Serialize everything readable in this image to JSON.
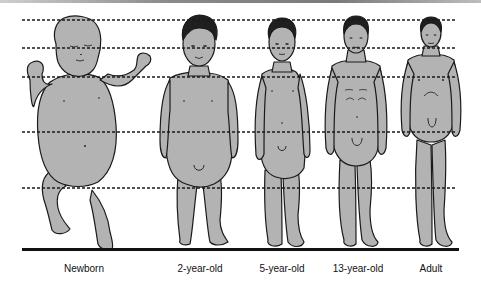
{
  "diagram": {
    "figures": [
      {
        "label": "Newborn",
        "center_x": 84
      },
      {
        "label": "2-year-old",
        "center_x": 200
      },
      {
        "label": "5-year-old",
        "center_x": 282
      },
      {
        "label": "13-year-old",
        "center_x": 356
      },
      {
        "label": "Adult",
        "center_x": 431
      }
    ],
    "reference_lines_y": [
      20,
      48,
      77,
      132,
      188
    ],
    "ground_line_y": 249,
    "colors": {
      "figure_fill": "#b3b3b3",
      "outline": "#1a1a1a",
      "hair": "#1f1f1f",
      "dashed_line": "#1a1a1a",
      "background": "#ffffff"
    }
  }
}
